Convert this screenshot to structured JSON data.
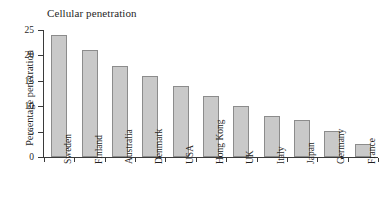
{
  "chart_data": {
    "type": "bar",
    "title": "Cellular penetration",
    "xlabel": "",
    "ylabel": "Percentage penetration",
    "ylim": [
      0,
      25
    ],
    "yticks": [
      0,
      5,
      10,
      15,
      20,
      25
    ],
    "ytick_labels": [
      "0",
      "5",
      "10",
      "15",
      "20",
      "25"
    ],
    "grid": false,
    "legend": null,
    "categories": [
      "Sweden",
      "Finland",
      "Australia",
      "Denmark",
      "USA",
      "Hong Kong",
      "UK",
      "Italy",
      "Japan",
      "Germany",
      "France"
    ],
    "values": [
      24,
      21,
      18,
      16,
      14,
      12,
      10,
      8,
      7.2,
      5.2,
      2.6
    ],
    "bar_fill_color": "#c9c9c9",
    "bar_edge_color": "#8c8c8c",
    "axis_color": "#3a3a3a",
    "background_color": "#ffffff"
  }
}
